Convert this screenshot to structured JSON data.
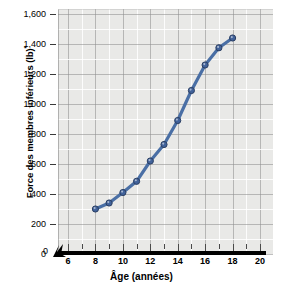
{
  "chart_data": {
    "type": "line",
    "title": "",
    "xlabel": "Âge (années)",
    "ylabel": "Force des membres inférieurs (lb)",
    "ylabel_superscript": "*",
    "x": [
      8,
      9,
      10,
      11,
      12,
      13,
      14,
      15,
      16,
      17,
      18
    ],
    "values": [
      300,
      340,
      410,
      485,
      620,
      730,
      890,
      1090,
      1260,
      1375,
      1440
    ],
    "series": [
      {
        "name": "Force des membres inférieurs",
        "values": [
          300,
          340,
          410,
          485,
          620,
          730,
          890,
          1090,
          1260,
          1375,
          1440
        ]
      }
    ],
    "xlim": [
      6,
      20
    ],
    "ylim": [
      0,
      1600
    ],
    "x_ticks": [
      "6",
      "8",
      "10",
      "12",
      "14",
      "16",
      "18",
      "20"
    ],
    "x_tick_values": [
      6,
      8,
      10,
      12,
      14,
      16,
      18,
      20
    ],
    "x_minor_step": 1,
    "y_ticks": [
      "0",
      "200",
      "400",
      "600",
      "800",
      "1,000",
      "1,200",
      "1,400",
      "1,600"
    ],
    "y_tick_values": [
      0,
      200,
      400,
      600,
      800,
      1000,
      1200,
      1400,
      1600
    ],
    "y_origin_label": "0",
    "axis_break": true,
    "axis_break_note": "x-axis broken between 0 and 6",
    "grid": true,
    "legend": "none",
    "line_color": "#4a6fa5",
    "marker_color": "#41629a",
    "marker_edge_color": "#2b3f63",
    "plot_bg": "#e9e9e7"
  }
}
